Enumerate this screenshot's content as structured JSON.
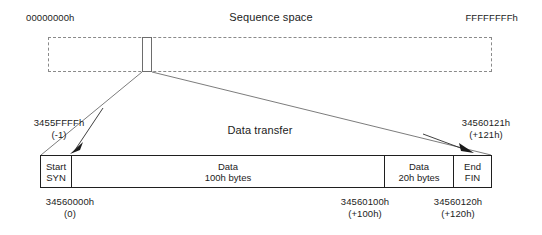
{
  "diagram": {
    "title": "Sequence space",
    "sequence_space": {
      "start_label": "00000000h",
      "end_label": "FFFFFFFFh",
      "band_style": "dashed",
      "highlight_label": "zoomed-region"
    },
    "detail": {
      "title": "Data transfer",
      "left_boundary": {
        "hex": "3455FFFFh",
        "offset": "(-1)"
      },
      "right_boundary": {
        "hex": "34560121h",
        "offset": "(+121h)"
      },
      "segments": [
        {
          "name": "start-syn",
          "line1": "Start",
          "line2": "SYN"
        },
        {
          "name": "data-100h",
          "line1": "Data",
          "line2": "100h bytes"
        },
        {
          "name": "data-20h",
          "line1": "Data",
          "line2": "20h bytes"
        },
        {
          "name": "end-fin",
          "line1": "End",
          "line2": "FIN"
        }
      ],
      "offsets": [
        {
          "name": "offset-0",
          "hex": "34560000h",
          "delta": "(0)"
        },
        {
          "name": "offset-100h",
          "hex": "34560100h",
          "delta": "(+100h)"
        },
        {
          "name": "offset-120h",
          "hex": "34560120h",
          "delta": "(+120h)"
        }
      ]
    },
    "colors": {
      "ink": "#1c1c1c",
      "rule": "#1f1f1f",
      "dashed_rule": "#8a8a8a",
      "background": "#ffffff"
    }
  }
}
